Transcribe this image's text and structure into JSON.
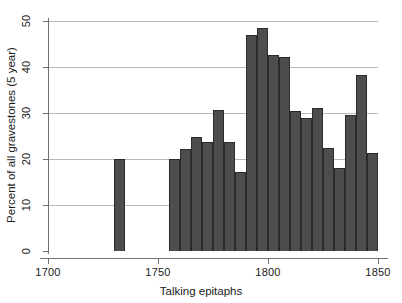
{
  "chart_data": {
    "type": "bar",
    "title": "",
    "subtitle": "",
    "xlabel": "Talking epitaphs",
    "ylabel": "Percent of all gravestones (5 year)",
    "xlim": [
      1695,
      1855
    ],
    "ylim": [
      0,
      50
    ],
    "xticks": [
      1700,
      1750,
      1800,
      1850
    ],
    "xtick_labels": [
      "1700",
      "1750",
      "1800",
      "1850"
    ],
    "yticks": [
      0,
      10,
      20,
      30,
      40,
      50
    ],
    "ytick_labels": [
      "0",
      "10",
      "20",
      "30",
      "40",
      "50"
    ],
    "grid": "horizontal",
    "legend": "none",
    "bin_width": 5,
    "bar_color": "#4d4d4d",
    "bar_edge_color": "#2b2b2b",
    "grid_color": "#b9b9b9",
    "axis_color": "#6f6f6f",
    "bins": [
      {
        "start": 1730,
        "end": 1735,
        "value": 20.0
      },
      {
        "start": 1755,
        "end": 1760,
        "value": 20.0
      },
      {
        "start": 1760,
        "end": 1765,
        "value": 22.1
      },
      {
        "start": 1765,
        "end": 1770,
        "value": 24.8
      },
      {
        "start": 1770,
        "end": 1775,
        "value": 23.7
      },
      {
        "start": 1775,
        "end": 1780,
        "value": 30.6
      },
      {
        "start": 1780,
        "end": 1785,
        "value": 23.8
      },
      {
        "start": 1785,
        "end": 1790,
        "value": 17.2
      },
      {
        "start": 1790,
        "end": 1795,
        "value": 47.0
      },
      {
        "start": 1795,
        "end": 1800,
        "value": 48.5
      },
      {
        "start": 1800,
        "end": 1805,
        "value": 42.6
      },
      {
        "start": 1805,
        "end": 1810,
        "value": 42.1
      },
      {
        "start": 1810,
        "end": 1815,
        "value": 30.5
      },
      {
        "start": 1815,
        "end": 1820,
        "value": 29.0
      },
      {
        "start": 1820,
        "end": 1825,
        "value": 31.0
      },
      {
        "start": 1825,
        "end": 1830,
        "value": 22.5
      },
      {
        "start": 1830,
        "end": 1835,
        "value": 18.1
      },
      {
        "start": 1835,
        "end": 1840,
        "value": 29.5
      },
      {
        "start": 1840,
        "end": 1845,
        "value": 38.3
      },
      {
        "start": 1845,
        "end": 1850,
        "value": 21.4
      }
    ]
  }
}
